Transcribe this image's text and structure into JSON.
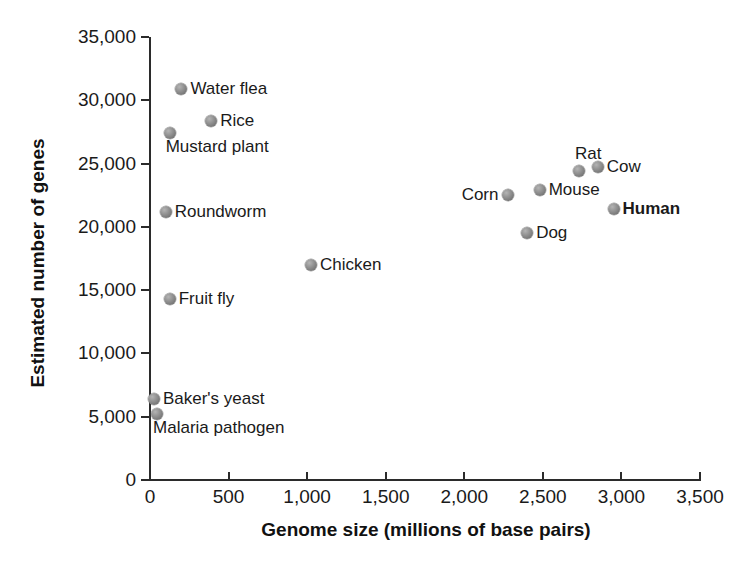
{
  "chart_data": {
    "type": "scatter",
    "title": "",
    "xlabel": "Genome size (millions of base pairs)",
    "ylabel": "Estimated number of genes",
    "xlim": [
      0,
      3500
    ],
    "ylim": [
      0,
      35000
    ],
    "grid": false,
    "legend": "none",
    "x_ticks": [
      "0",
      "500",
      "1,000",
      "1,500",
      "2,000",
      "2,500",
      "3,000",
      "3,500"
    ],
    "x_tick_values": [
      0,
      500,
      1000,
      1500,
      2000,
      2500,
      3000,
      3500
    ],
    "y_ticks": [
      "0",
      "5,000",
      "10,000",
      "15,000",
      "20,000",
      "25,000",
      "30,000",
      "35,000"
    ],
    "y_tick_values": [
      0,
      5000,
      10000,
      15000,
      20000,
      25000,
      30000,
      35000
    ],
    "marker_color": "#8a8a8a",
    "axis_color": "#2b2b2b",
    "background_color": "#ffffff",
    "points": [
      {
        "label": "Water flea",
        "x": 200,
        "y": 30900,
        "label_pos": "right",
        "bold": false
      },
      {
        "label": "Rice",
        "x": 390,
        "y": 28400,
        "label_pos": "right",
        "bold": false
      },
      {
        "label": "Mustard plant",
        "x": 125,
        "y": 27400,
        "label_pos": "below",
        "bold": false
      },
      {
        "label": "Roundworm",
        "x": 100,
        "y": 21200,
        "label_pos": "right",
        "bold": false
      },
      {
        "label": "Fruit fly",
        "x": 125,
        "y": 14300,
        "label_pos": "right",
        "bold": false
      },
      {
        "label": "Baker's yeast",
        "x": 25,
        "y": 6400,
        "label_pos": "right",
        "bold": false
      },
      {
        "label": "Malaria pathogen",
        "x": 45,
        "y": 5200,
        "label_pos": "below",
        "bold": false
      },
      {
        "label": "Chicken",
        "x": 1025,
        "y": 17000,
        "label_pos": "right",
        "bold": false
      },
      {
        "label": "Corn",
        "x": 2275,
        "y": 22500,
        "label_pos": "left",
        "bold": false
      },
      {
        "label": "Mouse",
        "x": 2480,
        "y": 22900,
        "label_pos": "right",
        "bold": false
      },
      {
        "label": "Rat",
        "x": 2730,
        "y": 24400,
        "label_pos": "above",
        "bold": false
      },
      {
        "label": "Cow",
        "x": 2850,
        "y": 24700,
        "label_pos": "right",
        "bold": false
      },
      {
        "label": "Human",
        "x": 2950,
        "y": 21400,
        "label_pos": "right",
        "bold": true
      },
      {
        "label": "Dog",
        "x": 2400,
        "y": 19500,
        "label_pos": "right",
        "bold": false
      }
    ]
  },
  "geometry": {
    "plot_left_px": 150,
    "plot_right_px": 700,
    "plot_top_px": 37,
    "plot_bottom_px": 480
  }
}
